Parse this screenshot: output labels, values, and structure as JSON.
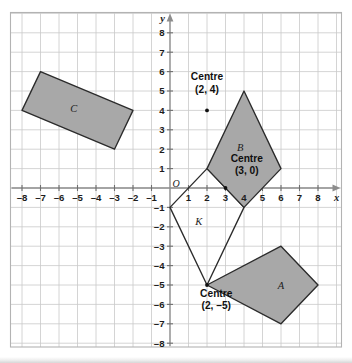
{
  "figure": {
    "background_color": "#ffffff",
    "shape_fill_color": "#a8a8a8",
    "shape_stroke_color": "#2b2b2b",
    "grid_color": "#c9c9c9",
    "axis_color": "#8d8d8d"
  },
  "chart_data": {
    "type": "scatter",
    "title": "",
    "xlabel": "x",
    "ylabel": "y",
    "xlim": [
      -9,
      9
    ],
    "ylim": [
      -9,
      9
    ],
    "grid": true,
    "legend": "none",
    "x_tick_labels": [
      "–8",
      "–7",
      "–6",
      "–5",
      "–4",
      "–3",
      "–2",
      "–1",
      "1",
      "2",
      "3",
      "4",
      "5",
      "6",
      "7",
      "8"
    ],
    "x_tick_values": [
      -8,
      -7,
      -6,
      -5,
      -4,
      -3,
      -2,
      -1,
      1,
      2,
      3,
      4,
      5,
      6,
      7,
      8
    ],
    "y_tick_labels": [
      "8",
      "7",
      "6",
      "5",
      "4",
      "3",
      "2",
      "1",
      "–1",
      "–2",
      "–3",
      "–4",
      "–5",
      "–6",
      "–7",
      "–8"
    ],
    "y_tick_values": [
      8,
      7,
      6,
      5,
      4,
      3,
      2,
      1,
      -1,
      -2,
      -3,
      -4,
      -5,
      -6,
      -7,
      -8
    ],
    "origin_label": "O",
    "shapes": [
      {
        "id": "K",
        "label": "K",
        "filled": false,
        "label_position": [
          1.55,
          -1.75
        ],
        "vertices": [
          [
            0,
            -1
          ],
          [
            2,
            1
          ],
          [
            4,
            -1
          ],
          [
            2,
            -5
          ]
        ]
      },
      {
        "id": "B",
        "label": "B",
        "filled": true,
        "label_position": [
          3.8,
          2.1
        ],
        "vertices": [
          [
            2,
            1
          ],
          [
            4,
            5
          ],
          [
            6,
            1
          ],
          [
            4,
            -1
          ]
        ]
      },
      {
        "id": "C",
        "label": "C",
        "filled": true,
        "label_position": [
          -5.2,
          4.1
        ],
        "vertices": [
          [
            -8,
            4
          ],
          [
            -7,
            6
          ],
          [
            -2,
            4
          ],
          [
            -3,
            2
          ]
        ]
      },
      {
        "id": "A",
        "label": "A",
        "filled": true,
        "label_position": [
          6.0,
          -5.0
        ],
        "vertices": [
          [
            2,
            -5
          ],
          [
            6,
            -3
          ],
          [
            8,
            -5
          ],
          [
            6,
            -7
          ]
        ]
      }
    ],
    "centres": [
      {
        "id": "centre-2-4",
        "caption_line1": "Centre",
        "caption_line2": "(2, 4)",
        "point": [
          2,
          4
        ],
        "caption_anchor": [
          2,
          5.55
        ]
      },
      {
        "id": "centre-3-0",
        "caption_line1": "Centre",
        "caption_line2": "(3, 0)",
        "point": [
          3,
          0
        ],
        "caption_anchor": [
          4.15,
          1.35
        ]
      },
      {
        "id": "centre-2-neg5",
        "caption_line1": "Centre",
        "caption_line2": "(2, –5)",
        "point": [
          2,
          -5
        ],
        "caption_anchor": [
          2.5,
          -5.6
        ]
      }
    ]
  }
}
